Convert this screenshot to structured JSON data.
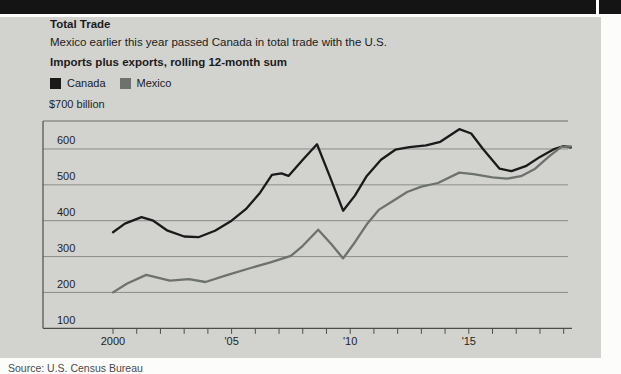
{
  "page": {
    "top_bar_color": "#141414",
    "panel_color": "#d2d3cf",
    "source_note": "Source: U.S. Census Bureau"
  },
  "header": {
    "title": "Total Trade",
    "subtitle": "Mexico earlier this year passed Canada in total trade with the U.S.",
    "caption": "Imports plus exports, rolling 12-month sum"
  },
  "chart_data": {
    "type": "line",
    "title": "Total Trade",
    "subtitle": "Mexico earlier this year passed Canada in total trade with the U.S.",
    "caption": "Imports plus exports, rolling 12-month sum",
    "unit_label": "$700 billion",
    "ylabel": "billions of U.S. dollars",
    "ylim": [
      100,
      700
    ],
    "y_gridlines": [
      600,
      500,
      400,
      300,
      200,
      100
    ],
    "x_range": [
      2000,
      2019.3
    ],
    "x_minor_tick_years": [
      2000,
      2001,
      2002,
      2003,
      2004,
      2005,
      2006,
      2007,
      2008,
      2009,
      2010,
      2011,
      2012,
      2013,
      2014,
      2015,
      2016,
      2017,
      2018,
      2019
    ],
    "x_tick_labels": [
      {
        "label": "2000",
        "year": 2000
      },
      {
        "label": "'05",
        "year": 2005
      },
      {
        "label": "'10",
        "year": 2010
      },
      {
        "label": "'15",
        "year": 2015
      }
    ],
    "grid_color": "#8b8c88",
    "axis_color": "#4d4d4a",
    "legend_position": "top-left",
    "series": [
      {
        "name": "Canada",
        "color": "#1a1a1a",
        "x": [
          2000.0,
          2000.5,
          2001.2,
          2001.7,
          2002.3,
          2003.0,
          2003.6,
          2004.3,
          2005.0,
          2005.6,
          2006.2,
          2006.7,
          2007.1,
          2007.4,
          2008.0,
          2008.6,
          2009.1,
          2009.7,
          2010.2,
          2010.7,
          2011.3,
          2011.9,
          2012.5,
          2013.2,
          2013.8,
          2014.6,
          2015.1,
          2015.6,
          2016.3,
          2016.8,
          2017.4,
          2018.0,
          2018.6,
          2019.0,
          2019.3
        ],
        "values": [
          368,
          392,
          410,
          400,
          372,
          356,
          354,
          372,
          400,
          432,
          478,
          528,
          532,
          525,
          570,
          613,
          530,
          428,
          470,
          525,
          570,
          598,
          605,
          610,
          620,
          655,
          643,
          600,
          545,
          538,
          552,
          578,
          600,
          608,
          604
        ]
      },
      {
        "name": "Mexico",
        "color": "#6d726e",
        "x": [
          2000.0,
          2000.6,
          2001.4,
          2002.4,
          2003.2,
          2003.9,
          2004.8,
          2005.8,
          2006.6,
          2007.5,
          2008.0,
          2008.65,
          2009.2,
          2009.7,
          2010.2,
          2010.7,
          2011.2,
          2011.8,
          2012.4,
          2013.0,
          2013.7,
          2014.6,
          2015.2,
          2016.0,
          2016.6,
          2017.2,
          2017.8,
          2018.4,
          2018.9,
          2019.3
        ],
        "values": [
          200,
          225,
          249,
          233,
          237,
          229,
          248,
          268,
          283,
          302,
          330,
          375,
          335,
          295,
          340,
          390,
          430,
          455,
          480,
          495,
          505,
          534,
          530,
          521,
          517,
          524,
          545,
          580,
          606,
          607
        ]
      }
    ]
  }
}
